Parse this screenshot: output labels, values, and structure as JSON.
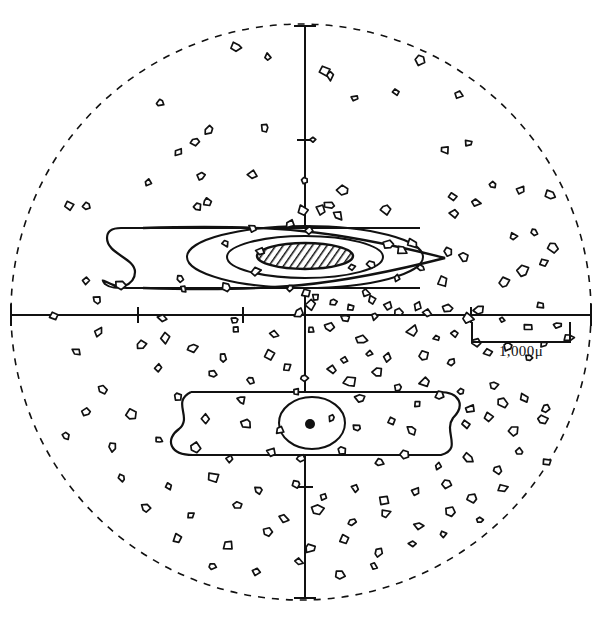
{
  "figure": {
    "background_color": "#ffffff",
    "ink_color": "#111111",
    "width": 602,
    "height": 635
  },
  "scale_bar": {
    "label": "1,000μ",
    "x_start": 472,
    "x_end": 570,
    "y": 322,
    "drop": 20,
    "label_x": 521,
    "label_y": 356
  },
  "field_boundary": {
    "name": "field-of-view-circle",
    "style": "dashed",
    "cx": 301,
    "cy": 312,
    "rx": 290,
    "ry": 288,
    "dash": "7,7"
  },
  "axes": {
    "horizontal": {
      "y": 315,
      "x_start": 11,
      "x_end": 591,
      "end_cap_half": 11,
      "ticks": [
        138,
        243,
        471
      ]
    },
    "vertical": {
      "x": 305,
      "y_start": 26,
      "y_end": 598,
      "end_cap_half": 11,
      "ticks": [
        140,
        487
      ]
    }
  },
  "upper_structure": {
    "name": "upper-spindle-body",
    "band": {
      "left": 113,
      "right": 420,
      "top": 228,
      "bottom": 288,
      "loop_end": "left"
    },
    "spindle_tip_x": 445,
    "ellipses": [
      {
        "cx": 305,
        "cy": 257,
        "rx": 118,
        "ry": 31,
        "label": "outer-contour"
      },
      {
        "cx": 305,
        "cy": 257,
        "rx": 78,
        "ry": 21,
        "label": "middle-contour"
      }
    ],
    "core": {
      "cx": 305,
      "cy": 256,
      "rx": 48,
      "ry": 13,
      "fill": "hatched",
      "label": "hatched-core"
    }
  },
  "lower_structure": {
    "name": "lower-band-body",
    "band": {
      "left": 175,
      "right": 455,
      "top": 392,
      "bottom": 455,
      "loop_end": "both"
    },
    "ellipse": {
      "cx": 312,
      "cy": 423,
      "rx": 33,
      "ry": 26
    },
    "center_dot": {
      "cx": 310,
      "cy": 424,
      "r": 5
    }
  },
  "chart_data": {
    "type": "scatter",
    "xlabel": "",
    "ylabel": "",
    "legend": [],
    "annotations": [
      "1,000μ"
    ],
    "marker": "irregular-polygon-outline",
    "point_count": 168,
    "points": [
      [
        236,
        47
      ],
      [
        268,
        57
      ],
      [
        330,
        75
      ],
      [
        420,
        60
      ],
      [
        324,
        71
      ],
      [
        160,
        103
      ],
      [
        355,
        98
      ],
      [
        396,
        92
      ],
      [
        265,
        128
      ],
      [
        209,
        130
      ],
      [
        313,
        140
      ],
      [
        459,
        95
      ],
      [
        469,
        143
      ],
      [
        444,
        150
      ],
      [
        493,
        185
      ],
      [
        178,
        152
      ],
      [
        195,
        142
      ],
      [
        148,
        183
      ],
      [
        201,
        176
      ],
      [
        253,
        175
      ],
      [
        343,
        190
      ],
      [
        305,
        180
      ],
      [
        68,
        205
      ],
      [
        87,
        206
      ],
      [
        197,
        207
      ],
      [
        207,
        202
      ],
      [
        303,
        211
      ],
      [
        321,
        210
      ],
      [
        330,
        205
      ],
      [
        338,
        215
      ],
      [
        386,
        209
      ],
      [
        452,
        196
      ],
      [
        521,
        190
      ],
      [
        455,
        213
      ],
      [
        475,
        203
      ],
      [
        534,
        232
      ],
      [
        553,
        247
      ],
      [
        290,
        224
      ],
      [
        309,
        230
      ],
      [
        253,
        228
      ],
      [
        225,
        243
      ],
      [
        261,
        252
      ],
      [
        388,
        245
      ],
      [
        402,
        250
      ],
      [
        413,
        243
      ],
      [
        550,
        195
      ],
      [
        86,
        281
      ],
      [
        121,
        285
      ],
      [
        180,
        278
      ],
      [
        256,
        271
      ],
      [
        352,
        267
      ],
      [
        371,
        265
      ],
      [
        397,
        278
      ],
      [
        421,
        268
      ],
      [
        443,
        281
      ],
      [
        448,
        252
      ],
      [
        464,
        257
      ],
      [
        513,
        237
      ],
      [
        544,
        263
      ],
      [
        523,
        271
      ],
      [
        504,
        283
      ],
      [
        183,
        289
      ],
      [
        227,
        287
      ],
      [
        290,
        288
      ],
      [
        306,
        292
      ],
      [
        316,
        297
      ],
      [
        365,
        293
      ],
      [
        97,
        300
      ],
      [
        311,
        305
      ],
      [
        333,
        302
      ],
      [
        351,
        308
      ],
      [
        372,
        300
      ],
      [
        388,
        306
      ],
      [
        417,
        306
      ],
      [
        448,
        308
      ],
      [
        479,
        310
      ],
      [
        540,
        305
      ],
      [
        54,
        316
      ],
      [
        163,
        318
      ],
      [
        235,
        320
      ],
      [
        299,
        313
      ],
      [
        345,
        318
      ],
      [
        374,
        316
      ],
      [
        399,
        312
      ],
      [
        428,
        313
      ],
      [
        468,
        318
      ],
      [
        502,
        320
      ],
      [
        528,
        327
      ],
      [
        558,
        325
      ],
      [
        98,
        332
      ],
      [
        165,
        338
      ],
      [
        236,
        329
      ],
      [
        274,
        335
      ],
      [
        311,
        330
      ],
      [
        329,
        327
      ],
      [
        413,
        331
      ],
      [
        361,
        340
      ],
      [
        437,
        338
      ],
      [
        455,
        334
      ],
      [
        476,
        342
      ],
      [
        544,
        344
      ],
      [
        569,
        338
      ],
      [
        76,
        352
      ],
      [
        141,
        345
      ],
      [
        192,
        348
      ],
      [
        223,
        358
      ],
      [
        269,
        355
      ],
      [
        287,
        367
      ],
      [
        344,
        360
      ],
      [
        369,
        354
      ],
      [
        387,
        358
      ],
      [
        423,
        356
      ],
      [
        451,
        362
      ],
      [
        488,
        352
      ],
      [
        508,
        346
      ],
      [
        529,
        358
      ],
      [
        158,
        368
      ],
      [
        212,
        374
      ],
      [
        251,
        380
      ],
      [
        304,
        378
      ],
      [
        332,
        370
      ],
      [
        350,
        382
      ],
      [
        377,
        372
      ],
      [
        398,
        388
      ],
      [
        425,
        382
      ],
      [
        461,
        392
      ],
      [
        493,
        385
      ],
      [
        102,
        390
      ],
      [
        178,
        396
      ],
      [
        241,
        400
      ],
      [
        296,
        392
      ],
      [
        360,
        398
      ],
      [
        418,
        404
      ],
      [
        440,
        395
      ],
      [
        470,
        409
      ],
      [
        502,
        403
      ],
      [
        524,
        398
      ],
      [
        546,
        408
      ],
      [
        87,
        412
      ],
      [
        131,
        415
      ],
      [
        205,
        418
      ],
      [
        246,
        424
      ],
      [
        280,
        430
      ],
      [
        332,
        418
      ],
      [
        357,
        428
      ],
      [
        392,
        421
      ],
      [
        412,
        430
      ],
      [
        466,
        424
      ],
      [
        489,
        418
      ],
      [
        513,
        430
      ],
      [
        543,
        420
      ],
      [
        66,
        436
      ],
      [
        112,
        447
      ],
      [
        159,
        440
      ],
      [
        196,
        448
      ],
      [
        230,
        459
      ],
      [
        272,
        452
      ],
      [
        301,
        458
      ],
      [
        342,
        450
      ],
      [
        379,
        462
      ],
      [
        404,
        455
      ],
      [
        438,
        466
      ],
      [
        468,
        458
      ],
      [
        497,
        470
      ],
      [
        520,
        452
      ],
      [
        547,
        462
      ],
      [
        122,
        478
      ],
      [
        168,
        486
      ],
      [
        213,
        478
      ],
      [
        259,
        490
      ],
      [
        296,
        484
      ],
      [
        324,
        497
      ],
      [
        355,
        488
      ],
      [
        384,
        500
      ],
      [
        416,
        492
      ],
      [
        447,
        484
      ],
      [
        472,
        498
      ],
      [
        503,
        488
      ],
      [
        146,
        508
      ],
      [
        191,
        515
      ],
      [
        237,
        505
      ],
      [
        283,
        518
      ],
      [
        318,
        510
      ],
      [
        352,
        522
      ],
      [
        385,
        514
      ],
      [
        419,
        526
      ],
      [
        450,
        512
      ],
      [
        480,
        520
      ],
      [
        178,
        538
      ],
      [
        227,
        545
      ],
      [
        268,
        532
      ],
      [
        310,
        548
      ],
      [
        345,
        540
      ],
      [
        378,
        552
      ],
      [
        412,
        544
      ],
      [
        443,
        534
      ],
      [
        212,
        566
      ],
      [
        256,
        572
      ],
      [
        299,
        562
      ],
      [
        340,
        575
      ],
      [
        374,
        566
      ]
    ]
  }
}
